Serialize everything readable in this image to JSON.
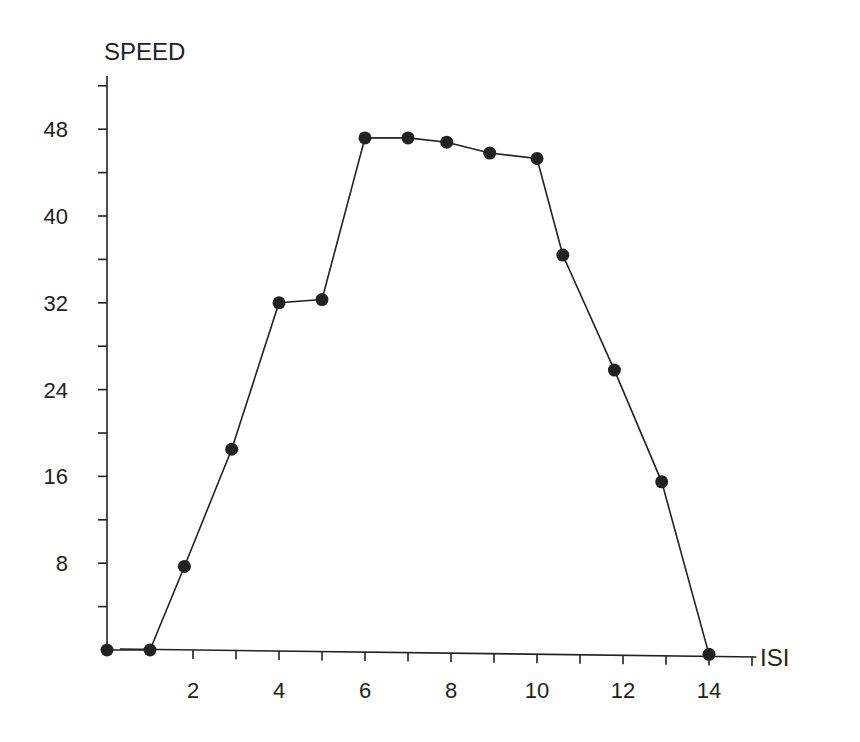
{
  "chart_data": {
    "type": "line",
    "title": "",
    "xlabel": "ISI",
    "ylabel": "SPEED",
    "xlim": [
      0,
      15
    ],
    "ylim": [
      0,
      52
    ],
    "x_ticks": [
      2,
      4,
      6,
      8,
      10,
      12,
      14
    ],
    "x_minor_tick_step": 1,
    "y_ticks": [
      8,
      16,
      24,
      32,
      40,
      48
    ],
    "y_minor_tick_step": 4,
    "grid": false,
    "legend": null,
    "marker": "filled-circle",
    "color": "#222222",
    "series": [
      {
        "name": "SPEED",
        "x": [
          0,
          1,
          1.8,
          2.9,
          4,
          5,
          6,
          7,
          7.9,
          8.9,
          10,
          10.6,
          11.8,
          12.9,
          14
        ],
        "values": [
          0,
          0,
          7.7,
          18.5,
          32,
          32.3,
          47.2,
          47.2,
          46.8,
          45.8,
          45.3,
          36.4,
          25.8,
          15.5,
          -0.4
        ]
      }
    ]
  },
  "axes": {
    "x_label": "ISI",
    "y_label": "SPEED",
    "x_tick_labels": [
      "2",
      "4",
      "6",
      "8",
      "10",
      "12",
      "14"
    ],
    "y_tick_labels": [
      "8",
      "16",
      "24",
      "32",
      "40",
      "48"
    ]
  }
}
